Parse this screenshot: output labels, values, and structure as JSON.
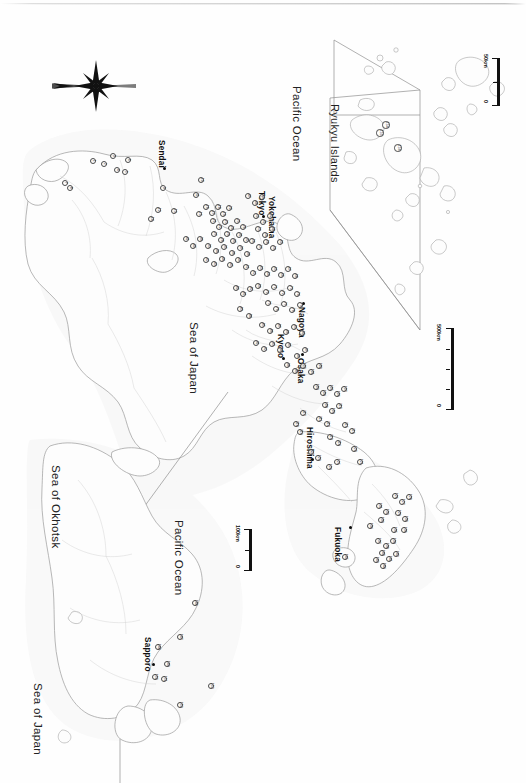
{
  "figure": {
    "type": "map",
    "orientation": "rotated-90-clockwise",
    "background_color": "#ffffff",
    "ink_color": "#1a1a1a",
    "coast_color": "#9a9a9a",
    "marker_fill": "#ffffff",
    "marker_stroke": "#4a4a4a"
  },
  "compass": {
    "name": "north-arrow",
    "label": ""
  },
  "sea_labels": [
    {
      "id": "sea-of-japan-main",
      "text": "Sea of Japan"
    },
    {
      "id": "pacific-ocean-main",
      "text": "Pacific Ocean"
    },
    {
      "id": "sea-of-okhotsk",
      "text": "Sea of Okhotsk"
    },
    {
      "id": "sea-of-japan-hokkaido",
      "text": "Sea of Japan"
    },
    {
      "id": "pacific-ocean-hokkaido",
      "text": "Pacific Ocean"
    }
  ],
  "city_labels": [
    {
      "id": "sendai",
      "text": "Sendai"
    },
    {
      "id": "tokyo",
      "text": "Tokyo"
    },
    {
      "id": "yokohama",
      "text": "Yokohama"
    },
    {
      "id": "nagoya",
      "text": "Nagoya"
    },
    {
      "id": "kyoto",
      "text": "Kyoto"
    },
    {
      "id": "osaka",
      "text": "Osaka"
    },
    {
      "id": "hiroshima",
      "text": "Hiroshima"
    },
    {
      "id": "fukuoka",
      "text": "Fukuoka"
    },
    {
      "id": "sapporo",
      "text": "Sapporo"
    }
  ],
  "insets": [
    {
      "id": "ryukyu",
      "title": "Ryukyu Islands"
    },
    {
      "id": "hokkaido",
      "title": ""
    }
  ],
  "scale_bars": [
    {
      "id": "scale-main",
      "min": "0",
      "max": "500km"
    },
    {
      "id": "scale-ryukyu",
      "min": "0",
      "max": "50km"
    },
    {
      "id": "scale-hokkaido",
      "min": "0",
      "max": "100km"
    }
  ],
  "site_markers": {
    "note": "numbered study sites",
    "honshu": [
      {
        "n": "1",
        "x": 93,
        "y": 161
      },
      {
        "n": "2",
        "x": 104,
        "y": 164
      },
      {
        "n": "3",
        "x": 113,
        "y": 156
      },
      {
        "n": "4",
        "x": 117,
        "y": 170
      },
      {
        "n": "5",
        "x": 125,
        "y": 172
      },
      {
        "n": "6",
        "x": 128,
        "y": 160
      },
      {
        "n": "7",
        "x": 65,
        "y": 183
      },
      {
        "n": "8",
        "x": 70,
        "y": 188
      },
      {
        "n": "9",
        "x": 163,
        "y": 188
      },
      {
        "n": "10",
        "x": 201,
        "y": 180
      },
      {
        "n": "11",
        "x": 196,
        "y": 195
      },
      {
        "n": "12",
        "x": 158,
        "y": 210
      },
      {
        "n": "13",
        "x": 174,
        "y": 211
      },
      {
        "n": "14",
        "x": 151,
        "y": 219
      },
      {
        "n": "15",
        "x": 199,
        "y": 214
      },
      {
        "n": "16",
        "x": 206,
        "y": 207
      },
      {
        "n": "17",
        "x": 212,
        "y": 213
      },
      {
        "n": "18",
        "x": 218,
        "y": 207
      },
      {
        "n": "19",
        "x": 223,
        "y": 214
      },
      {
        "n": "20",
        "x": 229,
        "y": 208
      },
      {
        "n": "21",
        "x": 213,
        "y": 221
      },
      {
        "n": "22",
        "x": 219,
        "y": 227
      },
      {
        "n": "23",
        "x": 225,
        "y": 222
      },
      {
        "n": "24",
        "x": 231,
        "y": 228
      },
      {
        "n": "25",
        "x": 237,
        "y": 221
      },
      {
        "n": "26",
        "x": 243,
        "y": 227
      },
      {
        "n": "27",
        "x": 214,
        "y": 234
      },
      {
        "n": "28",
        "x": 221,
        "y": 240
      },
      {
        "n": "29",
        "x": 227,
        "y": 234
      },
      {
        "n": "30",
        "x": 233,
        "y": 241
      },
      {
        "n": "31",
        "x": 239,
        "y": 235
      },
      {
        "n": "32",
        "x": 246,
        "y": 240
      },
      {
        "n": "33",
        "x": 208,
        "y": 246
      },
      {
        "n": "34",
        "x": 216,
        "y": 251
      },
      {
        "n": "35",
        "x": 224,
        "y": 247
      },
      {
        "n": "36",
        "x": 232,
        "y": 253
      },
      {
        "n": "37",
        "x": 240,
        "y": 248
      },
      {
        "n": "38",
        "x": 247,
        "y": 254
      },
      {
        "n": "39",
        "x": 200,
        "y": 239
      },
      {
        "n": "40",
        "x": 193,
        "y": 246
      },
      {
        "n": "41",
        "x": 186,
        "y": 239
      },
      {
        "n": "42",
        "x": 206,
        "y": 260
      },
      {
        "n": "43",
        "x": 214,
        "y": 264
      },
      {
        "n": "44",
        "x": 222,
        "y": 259
      },
      {
        "n": "45",
        "x": 230,
        "y": 265
      },
      {
        "n": "46",
        "x": 238,
        "y": 260
      },
      {
        "n": "47",
        "x": 248,
        "y": 196
      },
      {
        "n": "48",
        "x": 255,
        "y": 203
      },
      {
        "n": "49",
        "x": 262,
        "y": 197
      },
      {
        "n": "50",
        "x": 256,
        "y": 216
      },
      {
        "n": "51",
        "x": 263,
        "y": 222
      },
      {
        "n": "52",
        "x": 270,
        "y": 216
      },
      {
        "n": "53",
        "x": 258,
        "y": 229
      },
      {
        "n": "54",
        "x": 265,
        "y": 235
      },
      {
        "n": "55",
        "x": 272,
        "y": 229
      },
      {
        "n": "56",
        "x": 252,
        "y": 241
      },
      {
        "n": "57",
        "x": 259,
        "y": 247
      },
      {
        "n": "58",
        "x": 266,
        "y": 242
      },
      {
        "n": "59",
        "x": 273,
        "y": 248
      },
      {
        "n": "60",
        "x": 280,
        "y": 242
      },
      {
        "n": "61",
        "x": 246,
        "y": 267
      },
      {
        "n": "62",
        "x": 253,
        "y": 273
      },
      {
        "n": "63",
        "x": 260,
        "y": 268
      },
      {
        "n": "64",
        "x": 267,
        "y": 274
      },
      {
        "n": "65",
        "x": 274,
        "y": 269
      },
      {
        "n": "66",
        "x": 281,
        "y": 275
      },
      {
        "n": "67",
        "x": 288,
        "y": 269
      },
      {
        "n": "68",
        "x": 295,
        "y": 276
      },
      {
        "n": "69",
        "x": 258,
        "y": 286
      },
      {
        "n": "70",
        "x": 266,
        "y": 292
      },
      {
        "n": "71",
        "x": 274,
        "y": 287
      },
      {
        "n": "72",
        "x": 282,
        "y": 293
      },
      {
        "n": "73",
        "x": 290,
        "y": 288
      },
      {
        "n": "74",
        "x": 297,
        "y": 294
      },
      {
        "n": "75",
        "x": 268,
        "y": 303
      },
      {
        "n": "76",
        "x": 276,
        "y": 309
      },
      {
        "n": "77",
        "x": 284,
        "y": 304
      },
      {
        "n": "78",
        "x": 292,
        "y": 310
      },
      {
        "n": "79",
        "x": 300,
        "y": 305
      },
      {
        "n": "80",
        "x": 236,
        "y": 288
      },
      {
        "n": "81",
        "x": 243,
        "y": 294
      },
      {
        "n": "82",
        "x": 250,
        "y": 289
      },
      {
        "n": "83",
        "x": 240,
        "y": 309
      },
      {
        "n": "84",
        "x": 249,
        "y": 316
      },
      {
        "n": "85",
        "x": 262,
        "y": 325
      },
      {
        "n": "86",
        "x": 270,
        "y": 331
      },
      {
        "n": "87",
        "x": 278,
        "y": 326
      },
      {
        "n": "88",
        "x": 286,
        "y": 332
      },
      {
        "n": "89",
        "x": 294,
        "y": 327
      },
      {
        "n": "90",
        "x": 302,
        "y": 333
      },
      {
        "n": "91",
        "x": 256,
        "y": 343
      },
      {
        "n": "92",
        "x": 264,
        "y": 349
      },
      {
        "n": "93",
        "x": 272,
        "y": 344
      },
      {
        "n": "94",
        "x": 280,
        "y": 350
      },
      {
        "n": "95",
        "x": 288,
        "y": 345
      },
      {
        "n": "96",
        "x": 297,
        "y": 356
      },
      {
        "n": "97",
        "x": 305,
        "y": 350
      },
      {
        "n": "98",
        "x": 287,
        "y": 365
      },
      {
        "n": "99",
        "x": 295,
        "y": 371
      },
      {
        "n": "100",
        "x": 303,
        "y": 366
      },
      {
        "n": "101",
        "x": 311,
        "y": 372
      },
      {
        "n": "102",
        "x": 319,
        "y": 366
      },
      {
        "n": "103",
        "x": 316,
        "y": 387
      },
      {
        "n": "104",
        "x": 323,
        "y": 393
      },
      {
        "n": "105",
        "x": 330,
        "y": 388
      },
      {
        "n": "106",
        "x": 337,
        "y": 394
      },
      {
        "n": "107",
        "x": 344,
        "y": 389
      },
      {
        "n": "108",
        "x": 325,
        "y": 405
      },
      {
        "n": "109",
        "x": 332,
        "y": 411
      },
      {
        "n": "110",
        "x": 339,
        "y": 406
      },
      {
        "n": "111",
        "x": 319,
        "y": 419
      },
      {
        "n": "112",
        "x": 327,
        "y": 424
      },
      {
        "n": "113",
        "x": 330,
        "y": 437
      },
      {
        "n": "114",
        "x": 338,
        "y": 443
      },
      {
        "n": "115",
        "x": 345,
        "y": 425
      },
      {
        "n": "116",
        "x": 352,
        "y": 431
      },
      {
        "n": "117",
        "x": 303,
        "y": 413
      },
      {
        "n": "118",
        "x": 296,
        "y": 424
      },
      {
        "n": "119",
        "x": 300,
        "y": 432
      },
      {
        "n": "120",
        "x": 354,
        "y": 449
      },
      {
        "n": "121",
        "x": 360,
        "y": 462
      },
      {
        "n": "122",
        "x": 311,
        "y": 452
      },
      {
        "n": "123",
        "x": 318,
        "y": 458
      },
      {
        "n": "124",
        "x": 329,
        "y": 467
      },
      {
        "n": "125",
        "x": 337,
        "y": 462
      }
    ],
    "kyushu": [
      {
        "n": "126",
        "x": 395,
        "y": 496
      },
      {
        "n": "127",
        "x": 402,
        "y": 502
      },
      {
        "n": "128",
        "x": 409,
        "y": 497
      },
      {
        "n": "129",
        "x": 398,
        "y": 513
      },
      {
        "n": "130",
        "x": 405,
        "y": 519
      },
      {
        "n": "131",
        "x": 379,
        "y": 506
      },
      {
        "n": "132",
        "x": 386,
        "y": 512
      },
      {
        "n": "133",
        "x": 381,
        "y": 520
      },
      {
        "n": "134",
        "x": 370,
        "y": 526
      },
      {
        "n": "135",
        "x": 394,
        "y": 530
      },
      {
        "n": "136",
        "x": 404,
        "y": 530
      },
      {
        "n": "137",
        "x": 378,
        "y": 541
      },
      {
        "n": "138",
        "x": 386,
        "y": 546
      },
      {
        "n": "139",
        "x": 393,
        "y": 541
      },
      {
        "n": "140",
        "x": 382,
        "y": 553
      },
      {
        "n": "141",
        "x": 389,
        "y": 559
      },
      {
        "n": "142",
        "x": 396,
        "y": 554
      },
      {
        "n": "143",
        "x": 376,
        "y": 560
      },
      {
        "n": "144",
        "x": 383,
        "y": 566
      },
      {
        "n": "145",
        "x": 345,
        "y": 557
      }
    ],
    "hokkaido": [
      {
        "n": "146",
        "x": 195,
        "y": 603
      },
      {
        "n": "147",
        "x": 180,
        "y": 637
      },
      {
        "n": "148",
        "x": 158,
        "y": 647
      },
      {
        "n": "149",
        "x": 167,
        "y": 664
      },
      {
        "n": "150",
        "x": 155,
        "y": 677
      },
      {
        "n": "151",
        "x": 164,
        "y": 679
      },
      {
        "n": "152",
        "x": 211,
        "y": 686
      },
      {
        "n": "153",
        "x": 180,
        "y": 705
      }
    ],
    "ryukyu": [
      {
        "n": "154",
        "x": 386,
        "y": 125
      },
      {
        "n": "155",
        "x": 380,
        "y": 133
      },
      {
        "n": "156",
        "x": 398,
        "y": 148
      }
    ]
  }
}
